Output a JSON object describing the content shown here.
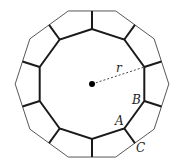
{
  "diagram": {
    "type": "concentric decagons with spokes",
    "center": {
      "x": 92,
      "y": 84
    },
    "inner_radius": 55,
    "outer_radius": 76.8,
    "sides": 10,
    "colors": {
      "stroke": "#1a1a1a",
      "outer_stroke": "#444444",
      "background": "#ffffff"
    },
    "labels": {
      "r": "r",
      "A": "A",
      "B": "B",
      "C": "C"
    }
  }
}
